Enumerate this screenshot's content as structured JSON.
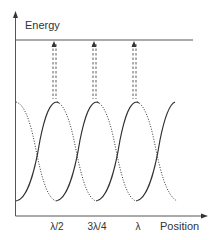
{
  "diagram": {
    "y_axis_label": "Energy",
    "x_axis_label": "Position",
    "x_ticks": [
      {
        "label": "λ/2",
        "x": 57
      },
      {
        "label": "3λ/4",
        "x": 97
      },
      {
        "label": "λ",
        "x": 138
      }
    ],
    "energy_level_line": true,
    "arrows": [
      {
        "x": 54,
        "description": "dashed up-arrow from wave peak to energy level"
      },
      {
        "x": 94,
        "description": "dashed up-arrow from wave peak to energy level"
      },
      {
        "x": 134,
        "description": "dashed up-arrow from wave peak to energy level"
      }
    ],
    "curves": {
      "solid": "rising segments of wave",
      "dotted": "falling segments of wave"
    },
    "colors": {
      "line": "#333333",
      "axis": "#555555"
    }
  }
}
